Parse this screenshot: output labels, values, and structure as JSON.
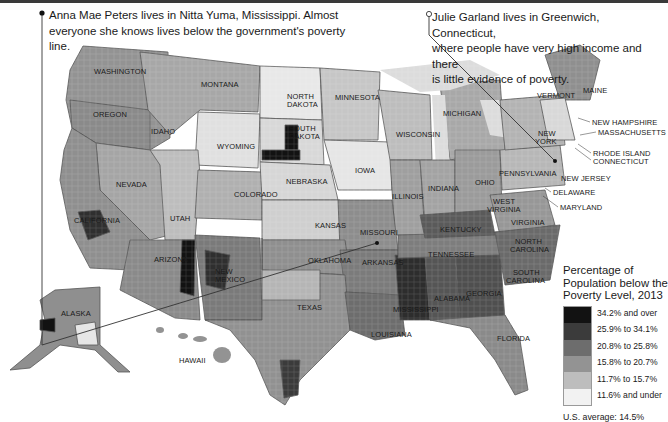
{
  "callouts": {
    "left": {
      "line1": "Anna Mae Peters lives in Nitta Yuma, Mississippi. Almost",
      "line2": "everyone she knows lives below the government's poverty line.",
      "marker": "filled-dot"
    },
    "right": {
      "line1": "Julie Garland lives in Greenwich, Connecticut,",
      "line2": "where people have very high income and there",
      "line3": "is little evidence of poverty.",
      "marker": "hollow-dot"
    }
  },
  "states": [
    {
      "name": "WASHINGTON",
      "x": 94,
      "y": 68
    },
    {
      "name": "MONTANA",
      "x": 201,
      "y": 81
    },
    {
      "name": "OREGON",
      "x": 93,
      "y": 111
    },
    {
      "name": "IDAHO",
      "x": 151,
      "y": 128
    },
    {
      "name": "WYOMING",
      "x": 217,
      "y": 143
    },
    {
      "name": "NORTH",
      "x": 287,
      "y": 93
    },
    {
      "name": "DAKOTA",
      "x": 287,
      "y": 101
    },
    {
      "name": "SOUTH",
      "x": 289,
      "y": 125
    },
    {
      "name": "DAKOTA",
      "x": 289,
      "y": 133
    },
    {
      "name": "MINNESOTA",
      "x": 335,
      "y": 94
    },
    {
      "name": "WISCONSIN",
      "x": 396,
      "y": 131
    },
    {
      "name": "MICHIGAN",
      "x": 443,
      "y": 110
    },
    {
      "name": "NEVADA",
      "x": 116,
      "y": 181
    },
    {
      "name": "UTAH",
      "x": 170,
      "y": 215
    },
    {
      "name": "COLORADO",
      "x": 234,
      "y": 191
    },
    {
      "name": "NEBRASKA",
      "x": 286,
      "y": 178
    },
    {
      "name": "IOWA",
      "x": 355,
      "y": 167
    },
    {
      "name": "ILLINOIS",
      "x": 392,
      "y": 193
    },
    {
      "name": "INDIANA",
      "x": 428,
      "y": 185
    },
    {
      "name": "OHIO",
      "x": 475,
      "y": 179
    },
    {
      "name": "KANSAS",
      "x": 315,
      "y": 222
    },
    {
      "name": "MISSOURI",
      "x": 360,
      "y": 229
    },
    {
      "name": "KENTUCKY",
      "x": 440,
      "y": 226
    },
    {
      "name": "WEST",
      "x": 493,
      "y": 198
    },
    {
      "name": "VIRGINIA",
      "x": 487,
      "y": 206
    },
    {
      "name": "VIRGINIA",
      "x": 511,
      "y": 219
    },
    {
      "name": "OKLAHOMA",
      "x": 308,
      "y": 257
    },
    {
      "name": "ARKANSAS",
      "x": 362,
      "y": 259
    },
    {
      "name": "TENNESSEE",
      "x": 428,
      "y": 251
    },
    {
      "name": "NORTH",
      "x": 515,
      "y": 238
    },
    {
      "name": "CAROLINA",
      "x": 510,
      "y": 246
    },
    {
      "name": "SOUTH",
      "x": 513,
      "y": 269
    },
    {
      "name": "CAROLINA",
      "x": 506,
      "y": 277
    },
    {
      "name": "ARIZONA",
      "x": 154,
      "y": 256
    },
    {
      "name": "NEW",
      "x": 215,
      "y": 268
    },
    {
      "name": "MEXICO",
      "x": 215,
      "y": 276
    },
    {
      "name": "TEXAS",
      "x": 297,
      "y": 304
    },
    {
      "name": "LOUISIANA",
      "x": 371,
      "y": 331
    },
    {
      "name": "MISSISSIPPI",
      "x": 393,
      "y": 306
    },
    {
      "name": "ALABAMA",
      "x": 434,
      "y": 295
    },
    {
      "name": "GEORGIA",
      "x": 466,
      "y": 290
    },
    {
      "name": "FLORIDA",
      "x": 497,
      "y": 335
    },
    {
      "name": "CALIFORNIA",
      "x": 74,
      "y": 217
    },
    {
      "name": "ALASKA",
      "x": 61,
      "y": 310
    },
    {
      "name": "HAWAII",
      "x": 179,
      "y": 357
    },
    {
      "name": "VERMONT",
      "x": 537,
      "y": 92
    },
    {
      "name": "MAINE",
      "x": 583,
      "y": 87
    },
    {
      "name": "NEW HAMPSHIRE",
      "x": 592,
      "y": 119
    },
    {
      "name": "MASSACHUSETTS",
      "x": 598,
      "y": 129
    },
    {
      "name": "NEW",
      "x": 538,
      "y": 130
    },
    {
      "name": "YORK",
      "x": 535,
      "y": 138
    },
    {
      "name": "RHODE ISLAND",
      "x": 593,
      "y": 150
    },
    {
      "name": "CONNECTICUT",
      "x": 593,
      "y": 158
    },
    {
      "name": "PENNSYLVANIA",
      "x": 499,
      "y": 170
    },
    {
      "name": "NEW JERSEY",
      "x": 561,
      "y": 175
    },
    {
      "name": "DELAWARE",
      "x": 553,
      "y": 189
    },
    {
      "name": "MARYLAND",
      "x": 560,
      "y": 204
    }
  ],
  "legend": {
    "title_line1": "Percentage of",
    "title_line2": "Population below the",
    "title_line3": "Poverty Level, 2013",
    "average": "U.S. average: 14.5%"
  },
  "colors": {
    "bin1": "#121212",
    "bin2": "#3b3b3b",
    "bin3": "#6d6d6d",
    "bin4": "#939393",
    "bin5": "#bdbdbd",
    "bin6": "#f2f2f2",
    "water": "#d8d8d8",
    "border": "#4a4a4a"
  },
  "chart_data": {
    "type": "heatmap",
    "title": "Percentage of Population below the Poverty Level, 2013",
    "subtitle": "U.S. county-level choropleth map",
    "legend": [
      {
        "label": "34.2% and over",
        "color": "#121212",
        "min": 34.2,
        "max": null
      },
      {
        "label": "25.9% to 34.1%",
        "color": "#3b3b3b",
        "min": 25.9,
        "max": 34.1
      },
      {
        "label": "20.8% to 25.8%",
        "color": "#6d6d6d",
        "min": 20.8,
        "max": 25.8
      },
      {
        "label": "15.8% to 20.7%",
        "color": "#939393",
        "min": 15.8,
        "max": 20.7
      },
      {
        "label": "11.7% to 15.7%",
        "color": "#bdbdbd",
        "min": 11.7,
        "max": 15.7
      },
      {
        "label": "11.6% and under",
        "color": "#f2f2f2",
        "min": null,
        "max": 11.6
      }
    ],
    "annotations": [
      "Anna Mae Peters lives in Nitta Yuma, Mississippi. Almost everyone she knows lives below the government's poverty line.",
      "Julie Garland lives in Greenwich, Connecticut, where people have very high income and there is little evidence of poverty."
    ],
    "us_average": "14.5%",
    "legend_position": "bottom-right"
  }
}
